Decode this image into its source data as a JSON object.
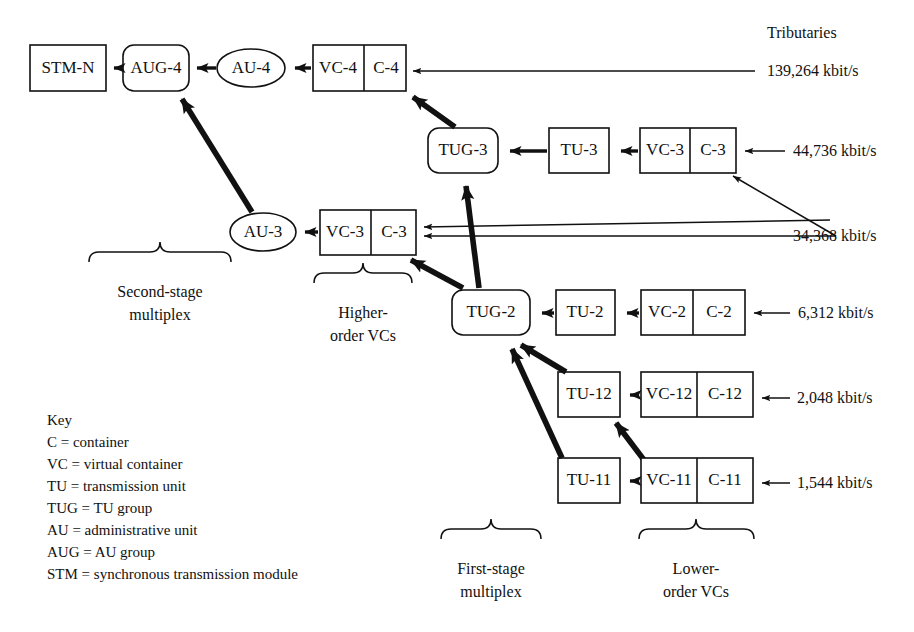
{
  "figure": {
    "header_right": "Tributaries",
    "stroke_color": "#111111",
    "background": "#ffffff"
  },
  "nodes": {
    "stm_n": "STM-N",
    "aug_4": "AUG-4",
    "au_4": "AU-4",
    "vc_4": "VC-4",
    "c_4": "C-4",
    "tug_3": "TUG-3",
    "tu_3": "TU-3",
    "vc_3_high": "VC-3",
    "c_3_high": "C-3",
    "au_3": "AU-3",
    "vc_3_low": "VC-3",
    "c_3_low": "C-3",
    "tug_2": "TUG-2",
    "tu_2": "TU-2",
    "vc_2": "VC-2",
    "c_2": "C-2",
    "tu_12": "TU-12",
    "vc_12": "VC-12",
    "c_12": "C-12",
    "tu_11": "TU-11",
    "vc_11": "VC-11",
    "c_11": "C-11"
  },
  "tributaries": [
    {
      "name": "rate-139264",
      "label": "139,264 kbit/s",
      "feeds": "C-4"
    },
    {
      "name": "rate-44736",
      "label": "44,736 kbit/s",
      "feeds": "C-3 (higher)"
    },
    {
      "name": "rate-34368",
      "label": "34,368 kbit/s",
      "feeds": "C-3 (both)"
    },
    {
      "name": "rate-6312",
      "label": "6,312 kbit/s",
      "feeds": "C-2"
    },
    {
      "name": "rate-2048",
      "label": "2,048 kbit/s",
      "feeds": "C-12"
    },
    {
      "name": "rate-1544",
      "label": "1,544 kbit/s",
      "feeds": "C-11"
    }
  ],
  "braces": [
    {
      "name": "second-stage-multiplex",
      "line1": "Second-stage",
      "line2": "multiplex"
    },
    {
      "name": "higher-order-vcs",
      "line1": "Higher-",
      "line2": "order VCs"
    },
    {
      "name": "first-stage-multiplex",
      "line1": "First-stage",
      "line2": "multiplex"
    },
    {
      "name": "lower-order-vcs",
      "line1": "Lower-",
      "line2": "order VCs"
    }
  ],
  "key": {
    "title": "Key",
    "entries": [
      "C = container",
      "VC = virtual container",
      "TU = transmission unit",
      "TUG = TU group",
      "AU = administrative unit",
      "AUG = AU group",
      "STM = synchronous transmission module"
    ]
  }
}
